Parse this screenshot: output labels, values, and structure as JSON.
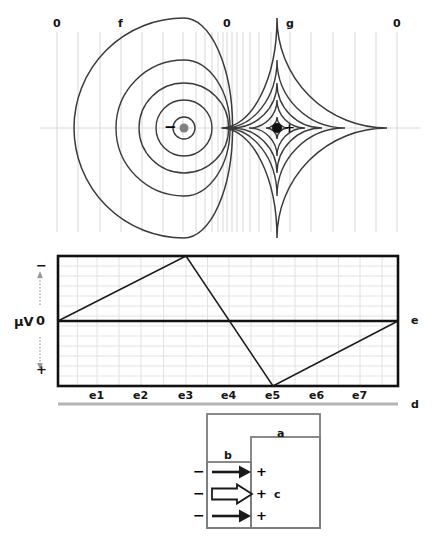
{
  "figure": {
    "type": "cardiac-dipole-electrogram-diagram",
    "panels": [
      "isopotential-field",
      "voltage-waveform",
      "depolarization-wavefront"
    ]
  },
  "field_panel": {
    "top_labels": [
      {
        "text": "0",
        "x": 57,
        "name": "zero-left"
      },
      {
        "text": "f",
        "x": 121,
        "name": "f-label"
      },
      {
        "text": "0",
        "x": 227,
        "name": "zero-center"
      },
      {
        "text": "g",
        "x": 290,
        "name": "g-label"
      },
      {
        "text": "0",
        "x": 397,
        "name": "zero-right"
      }
    ],
    "negative_pole": {
      "sign": "−",
      "sign_x": 166,
      "dot_cx": 184,
      "dot_cy": 128,
      "dot_r": 4.5,
      "dot_color": "#808080"
    },
    "positive_pole": {
      "sign": "+",
      "sign_x": 285,
      "dot_cx": 277,
      "dot_cy": 128,
      "dot_r": 5,
      "dot_color": "#111111"
    },
    "negative_contours_rx": [
      11,
      28,
      45,
      68,
      110
    ],
    "positive_contours_rx": [
      11,
      28,
      45,
      68,
      110
    ],
    "contour_color": "#3a3a3a",
    "gridline_color": "#d8d8d8",
    "gridline_x": [
      57,
      78,
      100,
      121,
      142,
      163,
      183,
      196,
      205,
      212,
      218,
      223,
      227,
      232,
      237,
      243,
      250,
      259,
      271,
      290,
      311,
      333,
      355,
      376,
      397
    ],
    "baseline_y": 128
  },
  "graph_panel": {
    "y_axis_unit": "μV",
    "y_axis_top_sign": "−",
    "y_axis_zero": "0",
    "y_axis_bottom_sign": "+",
    "right_label": "e",
    "bottom_label": "d",
    "x_tick_labels": [
      "e1",
      "e2",
      "e3",
      "e4",
      "e5",
      "e6",
      "e7"
    ],
    "x_tick_positions": [
      97,
      141,
      186,
      229,
      273,
      317,
      360
    ],
    "plot_left": 58,
    "plot_right": 398,
    "plot_top": 256,
    "plot_bottom": 386,
    "zero_line_y": 321,
    "grid_color": "#e2e2e2",
    "border_color": "#111111",
    "trace_color": "#1a1a1a",
    "waveform_points": [
      {
        "x": 58,
        "y": 321
      },
      {
        "x": 186,
        "y": 256
      },
      {
        "x": 273,
        "y": 386
      },
      {
        "x": 398,
        "y": 321
      }
    ],
    "baseline_bar_color": "#b4b4b4"
  },
  "circuit_panel": {
    "outer_label": "a",
    "inner_label": "b",
    "right_label": "c",
    "outer_box": {
      "x": 207,
      "y": 414,
      "w": 113,
      "h": 114
    },
    "inner_box": {
      "x": 207,
      "y": 462,
      "w": 44,
      "h": 66
    },
    "mid_box": {
      "x": 251,
      "y": 437,
      "w": 69,
      "h": 91
    },
    "box_color": "#7d7d7d",
    "arrows": [
      {
        "style": "solid",
        "y": 472,
        "minus": "−",
        "plus": "+"
      },
      {
        "style": "hollow",
        "y": 494,
        "minus": "−",
        "plus": "+"
      },
      {
        "style": "solid",
        "y": 516,
        "minus": "−",
        "plus": "+"
      }
    ],
    "arrow_color": "#1a1a1a"
  }
}
